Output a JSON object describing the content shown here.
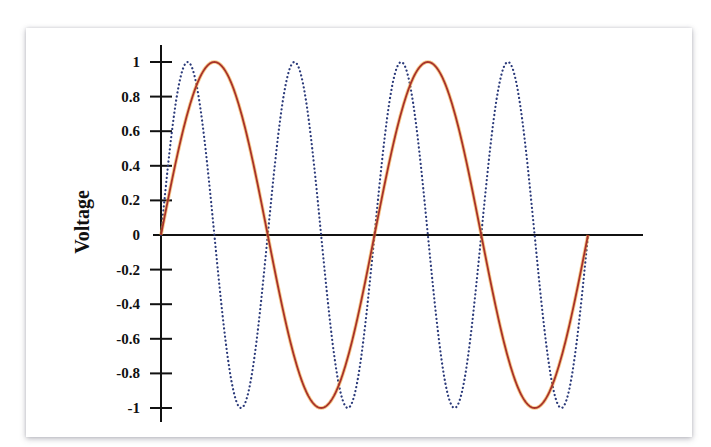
{
  "chart_data": {
    "type": "line",
    "title": "",
    "xlabel": "",
    "ylabel": "Voltage",
    "ylim": [
      -1,
      1
    ],
    "yticks": [
      1,
      0.8,
      0.6,
      0.4,
      0.2,
      0,
      -0.2,
      -0.4,
      -0.6,
      -0.8,
      -1
    ],
    "ytick_labels": [
      "1",
      "0.8",
      "0.6",
      "0.4",
      "0.2",
      "0",
      "-0.2",
      "-0.4",
      "-0.6",
      "-0.8",
      "-1"
    ],
    "x_range_cycles": [
      0,
      2
    ],
    "grid": false,
    "legend": null,
    "series": [
      {
        "name": "fundamental",
        "style": "solid",
        "color": "#a8322a",
        "glow": "#f0a030",
        "amplitude": 1,
        "cycles": 2,
        "description": "sine wave, 2 full cycles across x range"
      },
      {
        "name": "second-harmonic",
        "style": "dotted",
        "color": "#2b3a7a",
        "amplitude": 1,
        "cycles": 4,
        "description": "sine wave at double frequency, 4 full cycles across x range"
      }
    ]
  },
  "layout": {
    "origin_x": 161,
    "zero_y": 235,
    "px_per_unit_y": 173,
    "x_end": 588,
    "x_axis_right": 643,
    "y_axis_top": 45,
    "y_axis_bottom": 422
  }
}
